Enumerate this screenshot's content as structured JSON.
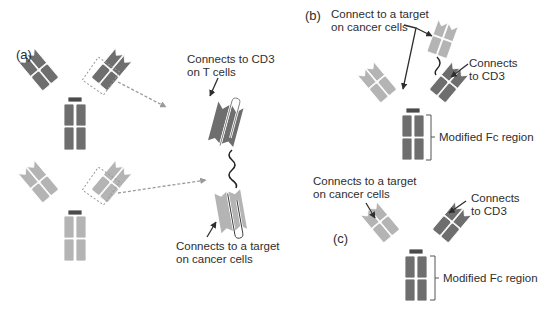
{
  "figure": {
    "panels": {
      "a": {
        "label": "(a)",
        "callouts": {
          "cd3": [
            "Connects to CD3",
            "on T cells"
          ],
          "target": [
            "Connects to a target",
            "on cancer cells"
          ]
        }
      },
      "b": {
        "label": "(b)",
        "callouts": {
          "target": [
            "Connect to a target",
            "on cancer cells"
          ],
          "cd3": [
            "Connects",
            "to CD3"
          ],
          "fc": "Modified Fc region"
        }
      },
      "c": {
        "label": "(c)",
        "callouts": {
          "target": [
            "Connects to a target",
            "on cancer cells"
          ],
          "cd3": [
            "Connects",
            "to CD3"
          ],
          "fc": "Modified Fc region"
        }
      }
    },
    "colors": {
      "dark_domain": "#6e6e6e",
      "light_domain": "#b4b4b4",
      "hinge": "#4a4a4a",
      "dashed_arrow": "#9a9a9a",
      "text": "#2e2e2e"
    }
  }
}
